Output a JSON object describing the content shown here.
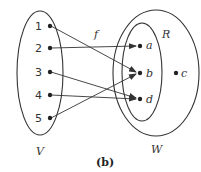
{
  "diagram": {
    "caption": "(b)",
    "function_label": "f",
    "domain_set": {
      "name": "V",
      "elements": [
        "1",
        "2",
        "3",
        "4",
        "5"
      ]
    },
    "codomain_set": {
      "name": "W",
      "elements": [
        "a",
        "b",
        "d",
        "c"
      ]
    },
    "range_set": {
      "name": "R",
      "elements": [
        "a",
        "b",
        "d"
      ]
    },
    "mappings": [
      {
        "from": "1",
        "to": "b"
      },
      {
        "from": "2",
        "to": "a"
      },
      {
        "from": "3",
        "to": "d"
      },
      {
        "from": "4",
        "to": "d"
      },
      {
        "from": "5",
        "to": "b"
      }
    ],
    "colors": {
      "stroke": "#333333",
      "background": "#ffffff"
    }
  }
}
